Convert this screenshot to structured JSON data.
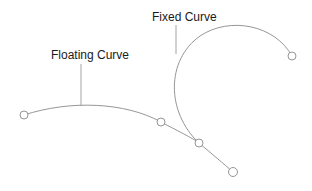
{
  "labels": {
    "floating_curve": "Floating Curve",
    "fixed_curve": "Fixed Curve"
  },
  "colors": {
    "curve": "#8a8a8a",
    "leader": "#9a9a9a",
    "handle": "#8a8a8a",
    "text": "#1a1a1a"
  },
  "diagram": {
    "fixed_curve": {
      "path": "M199,143 C166,112 166,60 200,36 C230,16 275,25 292,56",
      "end_handle": {
        "cx": 292,
        "cy": 56,
        "r": 4
      }
    },
    "floating_curve": {
      "path": "M24,115 C70,100 125,102 161,122 C180,132 196,140 199,143 C212,154 224,164 233,172",
      "handles": [
        {
          "cx": 24,
          "cy": 115,
          "r": 4
        },
        {
          "cx": 161,
          "cy": 122,
          "r": 4
        },
        {
          "cx": 199,
          "cy": 143,
          "r": 4
        },
        {
          "cx": 233,
          "cy": 172,
          "r": 4.5
        }
      ]
    },
    "leaders": {
      "floating": {
        "x1": 81,
        "y1": 64,
        "x2": 81,
        "y2": 106
      },
      "fixed": {
        "x1": 176,
        "y1": 25,
        "x2": 176,
        "y2": 54
      }
    }
  }
}
